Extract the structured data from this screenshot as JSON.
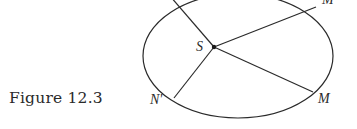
{
  "caption": "Figure 12.3",
  "labels": {
    "center": "S",
    "m_prime": "M'",
    "m": "M",
    "n_prime": "N'"
  },
  "colors": {
    "ink": "#2a2a2a",
    "background": "#ffffff"
  },
  "geometry": {
    "ellipse": {
      "cx": 238,
      "cy": 56,
      "rx": 95,
      "ry": 62
    },
    "focus": {
      "x": 214,
      "y": 47
    },
    "endpoints": {
      "n": {
        "x": 170,
        "y": -4
      },
      "m_prime": {
        "x": 316,
        "y": 7
      },
      "m": {
        "x": 313,
        "y": 92
      },
      "n_prime": {
        "x": 174,
        "y": 98
      }
    }
  }
}
